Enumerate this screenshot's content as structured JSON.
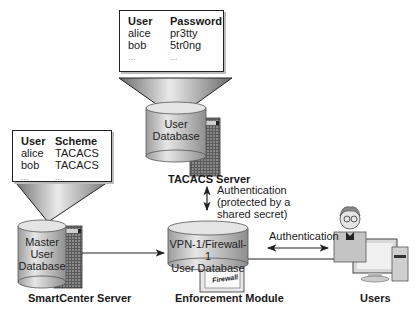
{
  "tacacs_table": {
    "headers": [
      "User",
      "Password"
    ],
    "rows": [
      [
        "alice",
        "pr3tty"
      ],
      [
        "bob",
        "5tr0ng"
      ],
      [
        "...",
        "..."
      ]
    ]
  },
  "smartcenter_table": {
    "headers": [
      "User",
      "Scheme"
    ],
    "rows": [
      [
        "alice",
        "TACACS"
      ],
      [
        "bob",
        "TACACS"
      ],
      [
        "...",
        "..."
      ]
    ]
  },
  "nodes": {
    "tacacs": {
      "db_label_1": "User",
      "db_label_2": "Database",
      "caption": "TACACS Server",
      "icon": "server-icon"
    },
    "smartcenter": {
      "db_label_1": "Master",
      "db_label_2": "User",
      "db_label_3": "Database",
      "caption": "SmartCenter Server",
      "icon": "server-icon"
    },
    "enforcement": {
      "db_label_1": "VPN-1/Firewall-1",
      "db_label_2": "User Database",
      "badge": "Firewall",
      "caption": "Enforcement Module",
      "icon": "firewall-icon"
    },
    "users": {
      "caption": "Users",
      "icon": "user-computer-icon"
    }
  },
  "edges": {
    "tacacs_enforcement": {
      "line1": "Authentication",
      "line2": "(protected by a",
      "line3": "shared secret)"
    },
    "enforcement_users": {
      "label": "Authentication"
    }
  },
  "colors": {
    "line": "#222222",
    "cylinder": "#c8c8c8",
    "server": "#6e6e6e",
    "callout": "#9a9a9a"
  }
}
